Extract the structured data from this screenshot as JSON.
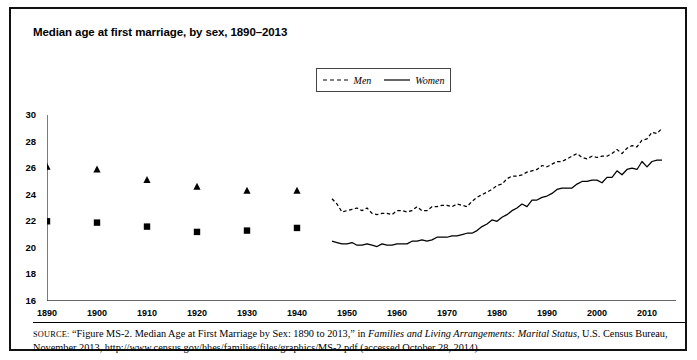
{
  "title": "Median age at first marriage, by sex, 1890–2013",
  "legend": {
    "position": "top-center",
    "items": [
      {
        "label": "Men",
        "style": "dashed",
        "marker": "triangle"
      },
      {
        "label": "Women",
        "style": "solid",
        "marker": "square"
      }
    ]
  },
  "source": {
    "prefix": "SOURCE:",
    "part1": " “Figure MS-2. Median Age at First Marriage by Sex: 1890 to 2013,” in ",
    "italic1": "Families and Living Arrangements: Marital Status",
    "part2": ", U.S. Census Bureau, November 2013, http://www.census.gov/hhes/families/files/graphics/MS-2.pdf (accessed October 28, 2014)"
  },
  "chart_data": {
    "type": "line",
    "title": "Median age at first marriage, by sex, 1890–2013",
    "xlabel": "",
    "ylabel": "",
    "xlim": [
      1890,
      2015
    ],
    "ylim": [
      16,
      30
    ],
    "yticks": [
      16,
      18,
      20,
      22,
      24,
      26,
      28,
      30
    ],
    "xticks": [
      1890,
      1900,
      1910,
      1920,
      1930,
      1940,
      1950,
      1960,
      1970,
      1980,
      1990,
      2000,
      2010
    ],
    "grid": false,
    "colors": {
      "men": "#000000",
      "women": "#000000",
      "frame": "#111111"
    },
    "series": [
      {
        "name": "Men",
        "style": "dashed",
        "marker_years": [
          1890,
          1900,
          1910,
          1920,
          1930,
          1940
        ],
        "marker_values": [
          26.1,
          25.9,
          25.1,
          24.6,
          24.3,
          24.3
        ],
        "x": [
          1947,
          1948,
          1949,
          1950,
          1951,
          1952,
          1953,
          1954,
          1955,
          1956,
          1957,
          1958,
          1959,
          1960,
          1961,
          1962,
          1963,
          1964,
          1965,
          1966,
          1967,
          1968,
          1969,
          1970,
          1971,
          1972,
          1973,
          1974,
          1975,
          1976,
          1977,
          1978,
          1979,
          1980,
          1981,
          1982,
          1983,
          1984,
          1985,
          1986,
          1987,
          1988,
          1989,
          1990,
          1991,
          1992,
          1993,
          1994,
          1995,
          1996,
          1997,
          1998,
          1999,
          2000,
          2001,
          2002,
          2003,
          2004,
          2005,
          2006,
          2007,
          2008,
          2009,
          2010,
          2011,
          2012,
          2013
        ],
        "values": [
          23.7,
          23.3,
          22.7,
          22.8,
          22.9,
          23.0,
          22.8,
          23.0,
          22.6,
          22.5,
          22.6,
          22.6,
          22.5,
          22.8,
          22.8,
          22.7,
          22.8,
          23.1,
          22.8,
          22.8,
          23.1,
          23.1,
          23.2,
          23.2,
          23.1,
          23.3,
          23.2,
          23.1,
          23.5,
          23.8,
          24.0,
          24.2,
          24.4,
          24.7,
          24.8,
          25.2,
          25.4,
          25.4,
          25.5,
          25.7,
          25.8,
          25.9,
          26.2,
          26.1,
          26.3,
          26.5,
          26.5,
          26.7,
          26.9,
          27.1,
          26.8,
          26.7,
          26.9,
          26.8,
          26.9,
          26.9,
          27.1,
          27.4,
          27.1,
          27.5,
          27.7,
          27.6,
          28.1,
          28.2,
          28.7,
          28.6,
          29.0
        ]
      },
      {
        "name": "Women",
        "style": "solid",
        "marker_years": [
          1890,
          1900,
          1910,
          1920,
          1930,
          1940
        ],
        "marker_values": [
          22.0,
          21.9,
          21.6,
          21.2,
          21.3,
          21.5
        ],
        "x": [
          1947,
          1948,
          1949,
          1950,
          1951,
          1952,
          1953,
          1954,
          1955,
          1956,
          1957,
          1958,
          1959,
          1960,
          1961,
          1962,
          1963,
          1964,
          1965,
          1966,
          1967,
          1968,
          1969,
          1970,
          1971,
          1972,
          1973,
          1974,
          1975,
          1976,
          1977,
          1978,
          1979,
          1980,
          1981,
          1982,
          1983,
          1984,
          1985,
          1986,
          1987,
          1988,
          1989,
          1990,
          1991,
          1992,
          1993,
          1994,
          1995,
          1996,
          1997,
          1998,
          1999,
          2000,
          2001,
          2002,
          2003,
          2004,
          2005,
          2006,
          2007,
          2008,
          2009,
          2010,
          2011,
          2012,
          2013
        ],
        "values": [
          20.5,
          20.4,
          20.3,
          20.3,
          20.4,
          20.2,
          20.2,
          20.3,
          20.2,
          20.1,
          20.3,
          20.2,
          20.2,
          20.3,
          20.3,
          20.3,
          20.5,
          20.5,
          20.6,
          20.5,
          20.6,
          20.8,
          20.8,
          20.8,
          20.9,
          20.9,
          21.0,
          21.1,
          21.1,
          21.3,
          21.6,
          21.8,
          22.1,
          22.0,
          22.3,
          22.5,
          22.8,
          23.0,
          23.3,
          23.1,
          23.6,
          23.6,
          23.8,
          23.9,
          24.1,
          24.4,
          24.5,
          24.5,
          24.5,
          24.8,
          25.0,
          25.0,
          25.1,
          25.1,
          24.9,
          25.3,
          25.3,
          25.8,
          25.5,
          25.9,
          26.0,
          25.9,
          26.5,
          26.1,
          26.5,
          26.6,
          26.6
        ]
      }
    ]
  }
}
